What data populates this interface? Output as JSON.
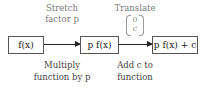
{
  "boxes": [
    {
      "id": "input",
      "label": "f(x)"
    },
    {
      "id": "stretched",
      "label": "p f(x)"
    },
    {
      "id": "translated",
      "label": "p f(x) + c"
    }
  ],
  "steps": [
    {
      "above_line1": "Stretch",
      "above_line2": "factor p",
      "below_line1": "Multiply",
      "below_line2": "function by p"
    },
    {
      "above_line1": "Translate",
      "vector_top": "0",
      "vector_bottom": "c",
      "below_line1": "Add c to",
      "below_line2": "function"
    }
  ],
  "colors": {
    "box_border": "#555555",
    "arrow": "#222222",
    "label_text": "#7a7a7a",
    "caption_text": "#444444"
  }
}
